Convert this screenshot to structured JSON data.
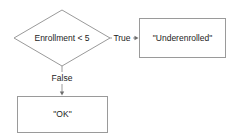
{
  "diagram": {
    "type": "flowchart",
    "background_color": "#ffffff",
    "stroke_color": "#9a9a9a",
    "text_color": "#1c1c1c",
    "nodes": [
      {
        "id": "decision",
        "shape": "diamond",
        "label": "Enrollment < 5",
        "center_x": 62,
        "center_y": 38
      },
      {
        "id": "true-result",
        "shape": "rectangle",
        "label": "\"Underenrolled\"",
        "center_x": 182,
        "center_y": 38
      },
      {
        "id": "false-result",
        "shape": "rectangle",
        "label": "\"OK\"",
        "center_x": 62,
        "center_y": 114
      }
    ],
    "edges": [
      {
        "id": "edge-true",
        "from": "decision",
        "to": "true-result",
        "label": "True",
        "label_x": 122,
        "label_y": 38,
        "direction": "right"
      },
      {
        "id": "edge-false",
        "from": "decision",
        "to": "false-result",
        "label": "False",
        "label_x": 62,
        "label_y": 78,
        "direction": "down"
      }
    ]
  }
}
